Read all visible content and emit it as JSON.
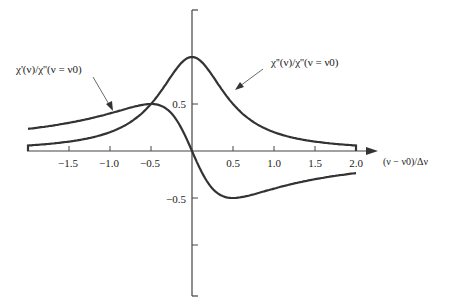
{
  "chart_data": {
    "type": "line",
    "title": "",
    "xlabel": "(ν − ν0)/Δν",
    "ylabel": "",
    "xlim": [
      -2.0,
      2.0
    ],
    "ylim": [
      -1.5,
      1.5
    ],
    "x_ticks": [
      "-1.5",
      "-1.0",
      "-0.5",
      "0.5",
      "1.0",
      "1.5",
      "2.0"
    ],
    "x_tick_values": [
      -1.5,
      -1.0,
      -0.5,
      0.5,
      1.0,
      1.5,
      2.0
    ],
    "y_ticks": [
      "0.5",
      "-0.5"
    ],
    "y_tick_values": [
      0.5,
      -0.5,
      -1.0
    ],
    "grid": false,
    "legend": "annotations with arrows",
    "x": [
      -2.0,
      -1.5,
      -1.0,
      -0.5,
      0.0,
      0.5,
      1.0,
      1.5,
      2.0
    ],
    "series": [
      {
        "name": "χ'(ν)/χ''(ν = ν0)",
        "description": "dispersion curve",
        "values": [
          0.24,
          0.3,
          0.4,
          0.5,
          0.0,
          -0.5,
          -0.4,
          -0.3,
          -0.24
        ]
      },
      {
        "name": "χ''(ν)/χ''(ν = ν0)",
        "description": "absorption (Lorentzian) curve",
        "values": [
          0.06,
          0.1,
          0.2,
          0.5,
          1.0,
          0.5,
          0.2,
          0.1,
          0.06
        ]
      }
    ],
    "annotations": [
      {
        "text": "χ'(ν)/χ''(ν = ν0)",
        "points_to": "dispersion curve near x = -0.9"
      },
      {
        "text": "χ''(ν)/χ''(ν = ν0)",
        "points_to": "absorption curve near x = 0.3"
      }
    ]
  },
  "labels": {
    "x_axis": "(ν − ν0)/Δν",
    "chi_prime": "χ'(ν)/χ''(ν = ν0)",
    "chi_double_prime": "χ''(ν)/χ''(ν = ν0)",
    "x_ticks": [
      "−1.5",
      "−1.0",
      "−0.5",
      "0.5",
      "1.0",
      "1.5",
      "2.0"
    ],
    "y_ticks": [
      "0.5",
      "−0.5"
    ]
  },
  "colors": {
    "curve": "#333333",
    "axis": "#444444",
    "text": "#222222",
    "background": "#ffffff"
  }
}
